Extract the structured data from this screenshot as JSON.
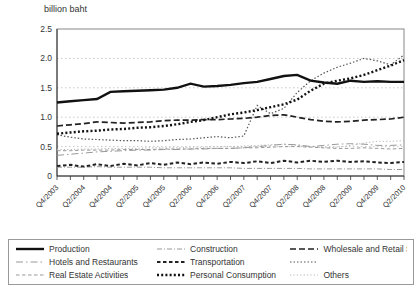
{
  "title": "billion baht",
  "chart_data": {
    "type": "line",
    "title": "billion baht",
    "xlabel": "",
    "ylabel": "billion baht",
    "ylim": [
      0,
      2.5
    ],
    "y_tick_labels": [
      "0",
      "0.5",
      "1.0",
      "1.5",
      "2.0",
      "2.5"
    ],
    "grid": "dotted horizontal gridlines every 0.5",
    "legend_position": "bottom boxed, 3 columns x 3 rows",
    "x": [
      "Q4/2003",
      "Q1/2004",
      "Q2/2004",
      "Q3/2004",
      "Q4/2004",
      "Q1/2005",
      "Q2/2005",
      "Q3/2005",
      "Q4/2005",
      "Q1/2006",
      "Q2/2006",
      "Q3/2006",
      "Q4/2006",
      "Q1/2007",
      "Q2/2007",
      "Q3/2007",
      "Q4/2007",
      "Q1/2008",
      "Q2/2008",
      "Q3/2008",
      "Q4/2008",
      "Q1/2009",
      "Q2/2009",
      "Q3/2009",
      "Q4/2009",
      "Q1/2010",
      "Q2/2010"
    ],
    "x_axis_labels_shown": [
      "Q4/2003",
      "Q2/2004",
      "Q4/2004",
      "Q2/2005",
      "Q4/2005",
      "Q2/2006",
      "Q4/2006",
      "Q2/2007",
      "Q4/2007",
      "Q2/2008",
      "Q4/2008",
      "Q2/2009",
      "Q4/2009",
      "Q2/2010"
    ],
    "series": [
      {
        "name": "production",
        "label": "Production",
        "color": "#111111",
        "width": 2.4,
        "dash": "",
        "values": [
          1.25,
          1.27,
          1.29,
          1.31,
          1.43,
          1.44,
          1.45,
          1.46,
          1.47,
          1.5,
          1.57,
          1.52,
          1.53,
          1.55,
          1.58,
          1.6,
          1.65,
          1.7,
          1.72,
          1.62,
          1.59,
          1.57,
          1.62,
          1.6,
          1.61,
          1.6,
          1.6
        ]
      },
      {
        "name": "construction",
        "label": "Construction",
        "color": "#999999",
        "width": 1,
        "dash": "5 2 1 2",
        "values": [
          0.15,
          0.15,
          0.15,
          0.16,
          0.15,
          0.15,
          0.15,
          0.15,
          0.14,
          0.14,
          0.14,
          0.14,
          0.14,
          0.14,
          0.13,
          0.13,
          0.13,
          0.13,
          0.13,
          0.12,
          0.12,
          0.12,
          0.12,
          0.12,
          0.12,
          0.11,
          0.11
        ]
      },
      {
        "name": "wholesale-and-retail-sale",
        "label": "Wholesale and Retail Sale",
        "color": "#222222",
        "width": 1.7,
        "dash": "6 3",
        "values": [
          0.85,
          0.87,
          0.89,
          0.92,
          0.91,
          0.9,
          0.91,
          0.92,
          0.94,
          0.95,
          0.95,
          0.96,
          0.96,
          0.97,
          0.98,
          1.0,
          1.03,
          1.04,
          1.0,
          0.96,
          0.93,
          0.92,
          0.93,
          0.95,
          0.96,
          0.97,
          1.0
        ]
      },
      {
        "name": "hotels-and-restaurants",
        "label": "Hotels and Restaurants",
        "color": "#999999",
        "width": 1,
        "dash": "7 3 1.5 3",
        "values": [
          0.35,
          0.37,
          0.39,
          0.41,
          0.42,
          0.43,
          0.44,
          0.44,
          0.45,
          0.45,
          0.46,
          0.46,
          0.47,
          0.47,
          0.48,
          0.5,
          0.52,
          0.54,
          0.53,
          0.5,
          0.52,
          0.54,
          0.55,
          0.54,
          0.52,
          0.52,
          0.53
        ]
      },
      {
        "name": "transportation",
        "label": "Transportation",
        "color": "#222222",
        "width": 2,
        "dash": "3.5 2.5",
        "values": [
          0.17,
          0.19,
          0.16,
          0.2,
          0.17,
          0.21,
          0.18,
          0.22,
          0.19,
          0.23,
          0.2,
          0.23,
          0.21,
          0.24,
          0.22,
          0.25,
          0.22,
          0.26,
          0.23,
          0.26,
          0.24,
          0.26,
          0.24,
          0.25,
          0.23,
          0.22,
          0.24
        ]
      },
      {
        "name": "unnamed-dotted-series",
        "label": "",
        "color": "#555555",
        "width": 1.2,
        "dash": "1.5 2",
        "values": [
          0.7,
          0.66,
          0.63,
          0.62,
          0.61,
          0.6,
          0.6,
          0.59,
          0.6,
          0.62,
          0.63,
          0.65,
          0.67,
          0.65,
          0.68,
          1.2,
          1.06,
          1.15,
          1.42,
          1.62,
          1.75,
          1.85,
          1.92,
          2.0,
          1.96,
          1.89,
          2.06
        ]
      },
      {
        "name": "real-estate-activities",
        "label": "Real Estate Activities",
        "color": "#999999",
        "width": 1,
        "dash": "3.5 2.5",
        "values": [
          0.43,
          0.43,
          0.44,
          0.44,
          0.44,
          0.45,
          0.45,
          0.45,
          0.46,
          0.46,
          0.46,
          0.47,
          0.47,
          0.47,
          0.48,
          0.48,
          0.49,
          0.5,
          0.5,
          0.49,
          0.48,
          0.47,
          0.47,
          0.48,
          0.47,
          0.46,
          0.47
        ]
      },
      {
        "name": "personal-consumption",
        "label": "Personal Consumption",
        "color": "#111111",
        "width": 2.4,
        "dash": "2 2.2",
        "values": [
          0.72,
          0.74,
          0.76,
          0.77,
          0.79,
          0.8,
          0.82,
          0.83,
          0.85,
          0.88,
          0.92,
          0.95,
          1.0,
          1.05,
          1.08,
          1.12,
          1.17,
          1.22,
          1.3,
          1.45,
          1.57,
          1.62,
          1.66,
          1.72,
          1.8,
          1.88,
          1.97
        ]
      },
      {
        "name": "others",
        "label": "Others",
        "color": "#b5b5b5",
        "width": 1,
        "dash": "1.2 2.2",
        "values": [
          0.45,
          0.45,
          0.46,
          0.46,
          0.47,
          0.47,
          0.47,
          0.48,
          0.48,
          0.48,
          0.49,
          0.49,
          0.5,
          0.5,
          0.51,
          0.52,
          0.53,
          0.54,
          0.52,
          0.5,
          0.48,
          0.49,
          0.52,
          0.56,
          0.59,
          0.59,
          0.6
        ]
      }
    ],
    "legend_order": [
      "production",
      "construction",
      "wholesale-and-retail-sale",
      "hotels-and-restaurants",
      "transportation",
      "unnamed-dotted-series",
      "real-estate-activities",
      "personal-consumption",
      "others"
    ],
    "colors": {
      "axis": "#333333",
      "frame": "#888888",
      "gridline": "#c8c8c8",
      "background": "#ffffff",
      "text": "#333333"
    }
  }
}
